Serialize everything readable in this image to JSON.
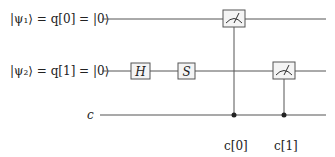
{
  "circuit": {
    "qubits": [
      {
        "label": "|ψ₁⟩ = q[0] = |0⟩",
        "y": 19
      },
      {
        "label": "|ψ₂⟩ = q[1] = |0⟩",
        "y": 71
      }
    ],
    "classical": {
      "label": "c",
      "y": 115
    },
    "gates": [
      {
        "name": "H",
        "qubit": 1,
        "x": 140
      },
      {
        "name": "S",
        "qubit": 1,
        "x": 186
      }
    ],
    "measurements": [
      {
        "qubit": 0,
        "x": 234,
        "target": "c[0]"
      },
      {
        "qubit": 1,
        "x": 284,
        "target": "c[1]"
      }
    ],
    "bit_labels": [
      "c[0]",
      "c[1]"
    ],
    "colors": {
      "line": "#555555",
      "box_fill": "#f4f4f4",
      "box_stroke": "#555555"
    }
  }
}
